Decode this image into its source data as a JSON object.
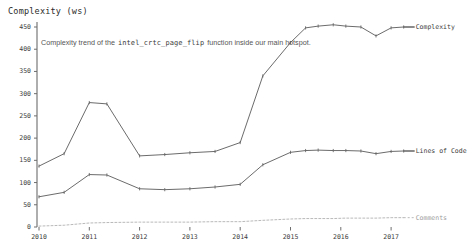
{
  "chart_data": {
    "type": "line",
    "title": "",
    "annotation": {
      "prefix": "Complexity trend of the",
      "code": "intel_crtc_page_flip",
      "suffix": "function inside our main hotspot."
    },
    "ylabel": "Complexity (ws)",
    "xlabel": "",
    "ylim": [
      0,
      470
    ],
    "xlim": [
      2009.8,
      2017.6
    ],
    "yticks": [
      0,
      50,
      100,
      150,
      200,
      250,
      300,
      350,
      400,
      450
    ],
    "ytick_labels": [
      "0",
      "50",
      "100",
      "150",
      "200",
      "250",
      "300",
      "350",
      "400",
      "450"
    ],
    "xticks": [
      2010,
      2011,
      2012,
      2013,
      2014,
      2015,
      2016,
      2017
    ],
    "xtick_labels": [
      "2010",
      "2011",
      "2012",
      "2013",
      "2014",
      "2015",
      "2016",
      "2017"
    ],
    "grid": false,
    "legend_position": "right-inline",
    "x": [
      2010.0,
      2010.5,
      2011.0,
      2011.35,
      2012.0,
      2012.5,
      2013.0,
      2013.5,
      2014.0,
      2014.45,
      2015.0,
      2015.3,
      2015.55,
      2015.85,
      2016.1,
      2016.4,
      2016.7,
      2017.0,
      2017.25
    ],
    "series": [
      {
        "name": "Complexity",
        "label": "Complexity",
        "color": "#5a5a5a",
        "style": "solid",
        "marker": "tick",
        "values": [
          137,
          165,
          280,
          277,
          160,
          163,
          167,
          170,
          190,
          340,
          415,
          448,
          452,
          455,
          452,
          450,
          430,
          448,
          450
        ]
      },
      {
        "name": "Lines of Code",
        "label": "Lines of Code",
        "color": "#5a5a5a",
        "style": "solid",
        "marker": "tick",
        "values": [
          68,
          78,
          118,
          117,
          86,
          84,
          86,
          90,
          96,
          140,
          168,
          172,
          173,
          172,
          172,
          171,
          165,
          170,
          171
        ]
      },
      {
        "name": "Comments",
        "label": "Comments",
        "color": "#b9b9b9",
        "style": "dashed",
        "marker": "none",
        "values": [
          2,
          4,
          9,
          10,
          11,
          11,
          11,
          12,
          12,
          15,
          18,
          19,
          19,
          19,
          20,
          20,
          20,
          21,
          21
        ]
      }
    ]
  }
}
